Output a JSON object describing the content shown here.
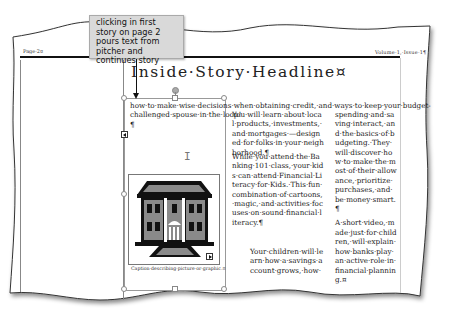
{
  "callout": {
    "text": "clicking in first story on page 2 pours text from pitcher and continues story"
  },
  "newsletter": {
    "header_left": "Page·2¤",
    "header_right": "Volume·1,·Issue·1¶",
    "headline": "Inside·Story·Headline¤"
  },
  "story": {
    "column1": {
      "paragraphs": [
        "how·to·make·wise·decisions·when·obtaining·credit,·and·ways·to·keep·your·budget-challenged·spouse·in·the·loop!¶"
      ]
    },
    "column2": {
      "paragraphs": [
        "You·will·learn·about·local·products,·investments,·and·mortgages·—designed·for·folks·in·your·neighborhood.¶",
        "While·you·attend·the·Banking·101·class,·your·kids·can·attend·Financial·Literacy·for·Kids.·This·fun·combination·of·cartoons,·magic,·and·activities·focuses·on·sound·financial·literacy.¶",
        "Your·children·will·learn·how·a·savings·account·grows,·how·"
      ]
    },
    "column3": {
      "paragraphs": [
        "spending·and·saving·interact,·and·the·basics·of·budgeting.·They·will·discover·how·to·make·the·most·of·their·allowance,·prioritize·purchases,·and·be·money·smart.¶",
        "A·short·video,·made·just·for·children,·will·explain·how·banks·play·an·active·role·in·financial·planning.¤"
      ]
    }
  },
  "picture": {
    "icon": "building-icon",
    "caption": "Caption·describing·picture·or·graphic.¤"
  },
  "colors": {
    "callout_bg": "#d9d9d9",
    "frame_border": "#999999",
    "building_fill": "#111111",
    "building_gray": "#8a8a8a"
  }
}
